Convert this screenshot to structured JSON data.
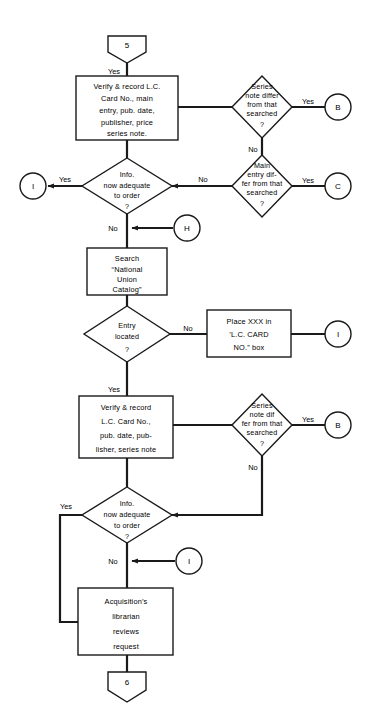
{
  "diagram": {
    "background_color": "#ffffff",
    "line_color": "#1a1a1a"
  },
  "connectors": [
    {
      "id": "start-5",
      "label": "5",
      "shape": "pentagon-down"
    },
    {
      "id": "end-6",
      "label": "6",
      "shape": "pentagon-down"
    },
    {
      "id": "circle-b-top",
      "label": "B",
      "shape": "circle"
    },
    {
      "id": "circle-c",
      "label": "C",
      "shape": "circle"
    },
    {
      "id": "circle-i-left",
      "label": "I",
      "shape": "circle"
    },
    {
      "id": "circle-h",
      "label": "H",
      "shape": "circle"
    },
    {
      "id": "circle-i-right",
      "label": "I",
      "shape": "circle"
    },
    {
      "id": "circle-b-bottom",
      "label": "B",
      "shape": "circle"
    },
    {
      "id": "circle-i-bottom",
      "label": "I",
      "shape": "circle"
    }
  ],
  "process_boxes": [
    {
      "id": "verify-record-top",
      "lines": [
        "Verify & record L.C.",
        "Card No., main",
        "entry, pub. date,",
        "publisher, price",
        "series note."
      ]
    },
    {
      "id": "search-nuc",
      "lines": [
        "Search",
        "“National",
        "Union",
        "Catalog”"
      ]
    },
    {
      "id": "place-xxx",
      "lines": [
        "Place XXX in",
        "’L.C. CARD",
        "NO.” box"
      ]
    },
    {
      "id": "verify-record-bottom",
      "lines": [
        "Verify & record",
        "L.C. Card No.,",
        "pub. date, pub-",
        "lisher, series note"
      ]
    },
    {
      "id": "acquisitions-librarian",
      "lines": [
        "Acquisition’s",
        "librarian",
        "reviews",
        "request"
      ]
    }
  ],
  "decisions": [
    {
      "id": "series-note-differ-top",
      "lines": [
        "Series",
        "note differ",
        "from that",
        "searched",
        "?"
      ],
      "yes": "Yes",
      "no": "No"
    },
    {
      "id": "main-entry-differ",
      "lines": [
        "Main",
        "entry dif-",
        "fer from that",
        "searched",
        "?"
      ],
      "yes": "Yes",
      "no": "No"
    },
    {
      "id": "info-adequate-top",
      "lines": [
        "Info.",
        "now adequate",
        "to order",
        "?"
      ],
      "yes": "Yes",
      "no": "No"
    },
    {
      "id": "entry-located",
      "lines": [
        "Entry",
        "located",
        "?"
      ],
      "yes": "Yes",
      "no": "No"
    },
    {
      "id": "series-note-differ-bottom",
      "lines": [
        "Series",
        "note dif",
        "fer from that",
        "searched",
        "?"
      ],
      "yes": "Yes",
      "no": "No"
    },
    {
      "id": "info-adequate-bottom",
      "lines": [
        "Info.",
        "now adequate",
        "to  order",
        "?"
      ],
      "yes": "Yes",
      "no": "No"
    }
  ],
  "edge_labels": {
    "start_yes": "Yes",
    "series_top_yes": "Yes",
    "series_top_no": "No",
    "main_entry_yes": "Yes",
    "main_entry_no": "No",
    "info_top_yes": "Yes",
    "info_top_no": "No",
    "entry_located_no": "No",
    "entry_located_yes": "Yes",
    "series_bottom_yes": "Yes",
    "series_bottom_no": "No",
    "info_bottom_yes": "Yes",
    "info_bottom_no": "No"
  }
}
